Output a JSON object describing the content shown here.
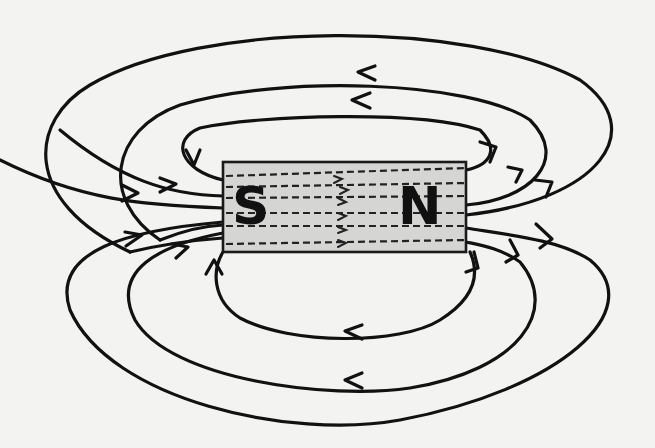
{
  "diagram": {
    "background": "#f3f3f2",
    "magnet": {
      "x": 223,
      "y": 162,
      "width": 243,
      "height": 90,
      "fill": "#d5d5d4",
      "poles": [
        {
          "label": "S",
          "x": 232,
          "y": 224
        },
        {
          "label": "N",
          "x": 398,
          "y": 224
        }
      ]
    },
    "field_lines": [
      {
        "name": "top-outer",
        "d": "M 130 252 C 20 200, 30 120, 90 85 C 200 20, 470 20, 580 80 C 650 130, 600 200, 466 215"
      },
      {
        "name": "top-middle",
        "d": "M 160 240 C 100 200, 110 130, 180 105 C 280 75, 470 80, 530 120 C 570 160, 530 200, 466 205"
      },
      {
        "name": "top-inner",
        "d": "M 223 180 C 180 170, 170 140, 200 128 C 260 115, 420 110, 480 130 C 500 150, 490 165, 466 170"
      },
      {
        "name": "left-upper-entry-1",
        "d": "M 130 252 C 160 245, 195 240, 223 238"
      },
      {
        "name": "left-upper-entry-2",
        "d": "M 160 240 C 180 232, 200 226, 223 225"
      },
      {
        "name": "left-mid-1",
        "d": "M 0 160 C 80 200, 140 205, 223 208"
      },
      {
        "name": "left-mid-2",
        "d": "M 60 130 C 120 180, 170 195, 223 196"
      },
      {
        "name": "bottom-outer",
        "d": "M 223 222 C 130 230, 50 250, 70 310 C 110 400, 290 440, 400 420 C 560 390, 650 310, 590 260 C 560 240, 510 235, 466 228"
      },
      {
        "name": "bottom-middle",
        "d": "M 223 233 C 160 245, 110 270, 135 320 C 170 380, 330 400, 410 388 C 520 370, 560 310, 520 262 C 500 248, 480 245, 466 242"
      },
      {
        "name": "bottom-inner",
        "d": "M 223 252 C 212 270, 212 300, 240 318 C 290 345, 400 345, 440 320 C 480 295, 478 270, 470 252"
      }
    ],
    "arrows": [
      {
        "name": "arrow-top-middle",
        "points": "375,66 358,72 375,80"
      },
      {
        "name": "arrow-top-inner",
        "points": "370,93 352,100 370,108"
      },
      {
        "name": "arrow-top-inner-down",
        "points": "186,150 194,165 200,150"
      },
      {
        "name": "arrow-left-entry-1",
        "points": "122,185 138,193 122,201"
      },
      {
        "name": "arrow-left-entry-2",
        "points": "160,178 176,184 160,192"
      },
      {
        "name": "arrow-left-lower-1",
        "points": "125,232 142,235 126,246"
      },
      {
        "name": "arrow-left-lower-2",
        "points": "172,244 188,247 176,258"
      },
      {
        "name": "arrow-bottom-inner-up",
        "points": "206,274 214,260 222,274"
      },
      {
        "name": "arrow-right-top-1",
        "points": "480,142 496,147 490,162"
      },
      {
        "name": "arrow-right-top-2",
        "points": "508,167 522,170 516,182"
      },
      {
        "name": "arrow-right-top-3",
        "points": "535,180 552,182 546,197"
      },
      {
        "name": "arrow-right-bottom-1",
        "points": "536,224 552,239 540,248"
      },
      {
        "name": "arrow-right-bottom-2",
        "points": "510,240 518,255 506,262"
      },
      {
        "name": "arrow-right-bottom-3",
        "points": "474,252 478,268 466,272"
      },
      {
        "name": "arrow-bottom-inner-left",
        "points": "362,325 345,331 362,339"
      },
      {
        "name": "arrow-bottom-middle-left",
        "points": "362,373 345,380 362,388"
      }
    ],
    "inner_lines": [
      {
        "d": "M 226 176 L 466 168"
      },
      {
        "d": "M 226 187 L 466 183"
      },
      {
        "d": "M 226 198 L 466 196"
      },
      {
        "d": "M 226 213 L 466 213"
      },
      {
        "d": "M 226 226 L 466 226"
      },
      {
        "d": "M 226 244 L 466 240"
      }
    ],
    "inner_arrows": [
      {
        "d": "M 334 176 L 342 179 L 334 183"
      },
      {
        "d": "M 340 187 L 348 190 L 340 194"
      },
      {
        "d": "M 338 198 L 346 202 L 338 205"
      },
      {
        "d": "M 338 213 L 346 216 L 338 220"
      },
      {
        "d": "M 338 227 L 346 230 L 338 233"
      },
      {
        "d": "M 338 240 L 346 243 L 338 247"
      }
    ]
  }
}
